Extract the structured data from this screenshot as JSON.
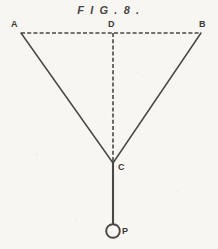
{
  "figure": {
    "title": "F I G . 8 .",
    "background_color": "#f7f6f3",
    "ink_color": "#4a4744",
    "label_color": "#3b3936",
    "canvas": {
      "width": 218,
      "height": 249
    },
    "points": {
      "A": {
        "label": "A",
        "x": 21,
        "y": 33
      },
      "B": {
        "label": "B",
        "x": 201,
        "y": 33
      },
      "C": {
        "label": "C",
        "x": 113,
        "y": 162
      },
      "D": {
        "label": "D",
        "x": 113,
        "y": 33
      },
      "P": {
        "label": "P",
        "x": 113,
        "y": 231
      }
    },
    "segments": [
      {
        "name": "A-D-B baseline",
        "from": "A",
        "to": "B",
        "style": "dashed"
      },
      {
        "name": "D-C vertical",
        "from": "D",
        "to": "C",
        "style": "dashed"
      },
      {
        "name": "A-C left ray",
        "from": "A",
        "to": "C",
        "style": "solid"
      },
      {
        "name": "B-C right ray",
        "from": "B",
        "to": "C",
        "style": "solid"
      },
      {
        "name": "C-P plumb",
        "from": "C",
        "to": "P",
        "style": "solid"
      }
    ],
    "marker": {
      "name": "P circle",
      "shape": "circle",
      "cx": 113,
      "cy": 231,
      "r": 7,
      "filled": false
    }
  }
}
